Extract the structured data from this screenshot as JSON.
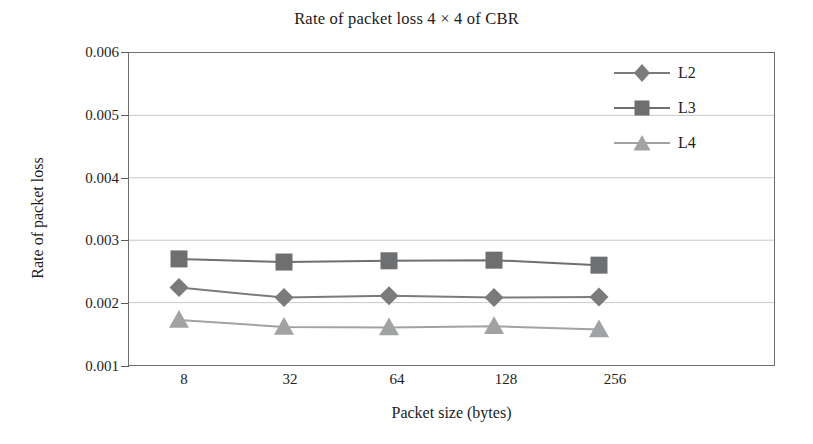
{
  "chart_data": {
    "type": "line",
    "title": "Rate of packet loss 4 × 4 of CBR",
    "xlabel": "Packet size (bytes)",
    "ylabel": "Rate of packet loss",
    "categories": [
      "8",
      "32",
      "64",
      "128",
      "256"
    ],
    "x": [
      8,
      32,
      64,
      128,
      256
    ],
    "ylim": [
      0.001,
      0.006
    ],
    "yticks": [
      "0.001",
      "0.002",
      "0.003",
      "0.004",
      "0.005",
      "0.006"
    ],
    "ytick_values": [
      0.001,
      0.002,
      0.003,
      0.004,
      0.005,
      0.006
    ],
    "grid": true,
    "grid_axis": "y",
    "legend_position": "top-right",
    "series": [
      {
        "name": "L2",
        "marker": "diamond",
        "color": "#7b7b7d",
        "values": [
          0.00224,
          0.00208,
          0.00211,
          0.00208,
          0.00209
        ]
      },
      {
        "name": "L3",
        "marker": "square",
        "color": "#6e6f71",
        "values": [
          0.0027,
          0.00265,
          0.00267,
          0.00268,
          0.0026
        ]
      },
      {
        "name": "L4",
        "marker": "triangle",
        "color": "#a0a2a4",
        "values": [
          0.00172,
          0.00161,
          0.0016,
          0.00162,
          0.00157
        ]
      }
    ]
  },
  "chart": {
    "title": "Rate of packet loss 4 × 4 of CBR",
    "x_axis_title": "Packet size (bytes)",
    "y_axis_title": "Rate of packet loss",
    "y_ticks": [
      "0.006",
      "0.005",
      "0.004",
      "0.003",
      "0.002",
      "0.001"
    ],
    "x_ticks": [
      "8",
      "32",
      "64",
      "128",
      "256"
    ],
    "legend": [
      {
        "label": "L2",
        "marker": "diamond-marker-icon"
      },
      {
        "label": "L3",
        "marker": "square-marker-icon"
      },
      {
        "label": "L4",
        "marker": "triangle-marker-icon"
      }
    ],
    "colors": {
      "frame": "#6d6e71",
      "gridline": "#c8c9cb",
      "series_l2": "#7b7b7d",
      "series_l3": "#6e6f71",
      "series_l4": "#a0a2a4",
      "text": "#221e1f",
      "background": "#ffffff"
    }
  }
}
